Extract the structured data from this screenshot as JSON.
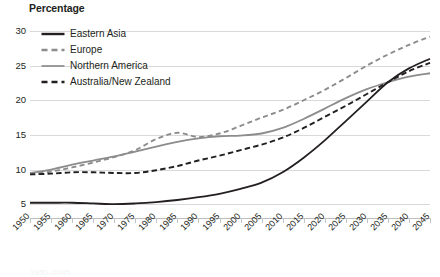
{
  "chart_data": {
    "type": "line",
    "title": "Percentage",
    "xlabel": "",
    "ylabel": "Percentage",
    "ylim": [
      3,
      30
    ],
    "xlim": [
      1950,
      2045
    ],
    "grid": true,
    "legend_position": "top-left",
    "yticks": [
      30,
      25,
      20,
      15,
      10,
      5
    ],
    "x": [
      1950,
      1955,
      1960,
      1965,
      1970,
      1975,
      1980,
      1985,
      1990,
      1995,
      2000,
      2005,
      2010,
      2015,
      2020,
      2025,
      2030,
      2035,
      2040,
      2045
    ],
    "categories": [
      "1950",
      "1955",
      "1960",
      "1965",
      "1970",
      "1975",
      "1980",
      "1985",
      "1990",
      "1995",
      "2000",
      "2005",
      "2010",
      "2015",
      "2020",
      "2025",
      "2030",
      "2035",
      "2040",
      "2045"
    ],
    "series": [
      {
        "name": "Eastern Asia",
        "color": "#231f20",
        "style": "solid",
        "values": [
          5.2,
          5.2,
          5.2,
          5.1,
          5.0,
          5.1,
          5.3,
          5.6,
          6.0,
          6.5,
          7.2,
          8.1,
          9.6,
          11.7,
          14.2,
          17.0,
          19.8,
          22.6,
          24.6,
          26.0
        ]
      },
      {
        "name": "Europe",
        "color": "#8c8c8c",
        "style": "dashed",
        "values": [
          9.3,
          9.7,
          10.3,
          11.0,
          11.8,
          12.8,
          14.4,
          15.3,
          14.7,
          15.2,
          16.3,
          17.5,
          18.6,
          20.0,
          21.5,
          23.2,
          25.0,
          26.6,
          28.0,
          29.2
        ]
      },
      {
        "name": "Northern America",
        "color": "#8c8c8c",
        "style": "solid",
        "values": [
          9.5,
          10.0,
          10.7,
          11.3,
          11.9,
          12.6,
          13.3,
          14.0,
          14.5,
          14.8,
          14.9,
          15.2,
          16.0,
          17.3,
          18.8,
          20.3,
          21.6,
          22.6,
          23.4,
          23.9
        ]
      },
      {
        "name": "Australia/New Zealand",
        "color": "#231f20",
        "style": "dashed",
        "values": [
          9.3,
          9.4,
          9.6,
          9.6,
          9.5,
          9.5,
          9.9,
          10.5,
          11.3,
          12.0,
          12.8,
          13.6,
          14.6,
          16.0,
          17.6,
          19.2,
          20.9,
          22.6,
          24.2,
          25.4
        ]
      }
    ]
  },
  "legend": {
    "items": [
      {
        "label": "Eastern Asia"
      },
      {
        "label": "Europe"
      },
      {
        "label": "Northern America"
      },
      {
        "label": "Australia/New Zealand"
      }
    ]
  },
  "caption": {
    "text": "1950–2045"
  }
}
